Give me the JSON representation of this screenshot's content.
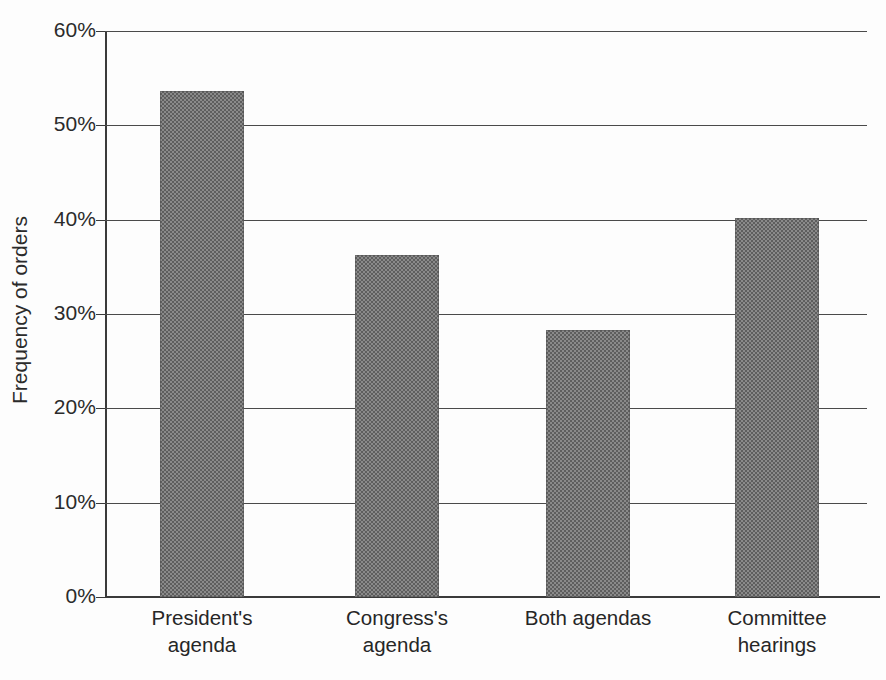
{
  "chart_data": {
    "type": "bar",
    "title": "",
    "subtitle": "",
    "xlabel": "",
    "ylabel": "Frequency of orders",
    "categories": [
      "President's\nagenda",
      "Congress's\nagenda",
      "Both agendas",
      "Committee\nhearings"
    ],
    "values": [
      53.6,
      36.3,
      28.3,
      40.2
    ],
    "value_labels": [
      "53.6%",
      "36.3%",
      "28.3%",
      "40.2%"
    ],
    "ylim": [
      0,
      60
    ],
    "ytick_values": [
      0,
      10,
      20,
      30,
      40,
      50,
      60
    ],
    "ytick_labels": [
      "0%",
      "10%",
      "20%",
      "30%",
      "40%",
      "50%",
      "60%"
    ],
    "grid": true,
    "grid_axis": "y",
    "legend": false,
    "legend_position": "none",
    "bar_fill": "#808080",
    "bar_pattern": "halftone-checker",
    "axis_color": "#3a3a3a",
    "background": "#fdfdfd"
  },
  "axes": {
    "y_title": "Frequency of orders"
  }
}
